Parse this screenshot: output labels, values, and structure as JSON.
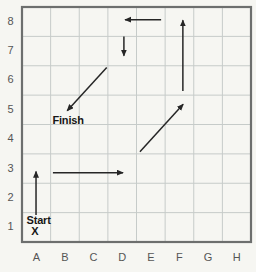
{
  "figure": {
    "columns": [
      "A",
      "B",
      "C",
      "D",
      "E",
      "F",
      "G",
      "H"
    ],
    "rows": [
      "1",
      "2",
      "3",
      "4",
      "5",
      "6",
      "7",
      "8"
    ],
    "markers": {
      "start": {
        "label": "Start",
        "symbol": "X",
        "cell": "A1",
        "label_pos": [
          0.58,
          0.62
        ],
        "symbol_pos": [
          0.45,
          0.23
        ]
      },
      "finish": {
        "label": "Finish",
        "cell": "B5",
        "label_pos": [
          1.61,
          4.03
        ]
      }
    },
    "path_arrows": [
      {
        "name": "leg-1",
        "direction": "up",
        "from": [
          0.49,
          0.92
        ],
        "to": [
          0.49,
          2.4
        ]
      },
      {
        "name": "leg-2",
        "direction": "right",
        "from": [
          1.08,
          2.36
        ],
        "to": [
          3.53,
          2.36
        ]
      },
      {
        "name": "leg-3",
        "direction": "up-right",
        "from": [
          4.12,
          3.07
        ],
        "to": [
          5.63,
          4.69
        ]
      },
      {
        "name": "leg-4",
        "direction": "up",
        "from": [
          5.62,
          5.14
        ],
        "to": [
          5.62,
          7.55
        ]
      },
      {
        "name": "leg-5",
        "direction": "left",
        "from": [
          4.86,
          7.57
        ],
        "to": [
          3.6,
          7.57
        ]
      },
      {
        "name": "leg-6",
        "direction": "down",
        "from": [
          3.56,
          7.0
        ],
        "to": [
          3.56,
          6.34
        ]
      },
      {
        "name": "leg-7",
        "direction": "down-left",
        "from": [
          2.96,
          5.94
        ],
        "to": [
          1.58,
          4.47
        ]
      }
    ],
    "colors": {
      "background": "#f6f6f2",
      "grid_line": "#c6cbc9",
      "grid_border": "#6d6f6e",
      "arrow": "#262626",
      "axis_label": "#555555",
      "marker_text": "#171717"
    }
  }
}
